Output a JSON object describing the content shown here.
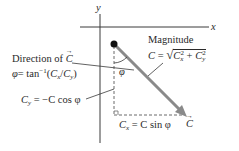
{
  "diagram": {
    "axes": {
      "x_label": "x",
      "y_label": "y"
    },
    "vector": {
      "name": "C",
      "label": "C",
      "color": "#8a8a8a"
    },
    "angle": {
      "symbol": "φ"
    },
    "labels": {
      "direction_title": "Direction of",
      "direction_vector": "C",
      "direction_formula_lhs": "φ",
      "direction_formula_eq": "= tan",
      "direction_formula_exp": "−1",
      "direction_formula_open": "(",
      "direction_formula_c1": "C",
      "direction_formula_c1_sub": "x",
      "direction_formula_slash": "/",
      "direction_formula_c2": "C",
      "direction_formula_c2_sub": "y",
      "direction_formula_close": ")",
      "magnitude_title": "Magnitude",
      "magnitude_lhs": "C",
      "magnitude_eq": "=",
      "magnitude_c1": "C",
      "magnitude_c1_sub": "x",
      "magnitude_c1_sup": "2",
      "magnitude_plus": "+",
      "magnitude_c2": "C",
      "magnitude_c2_sub": "y",
      "magnitude_c2_sup": "2",
      "cy_lhs": "C",
      "cy_sub": "y",
      "cy_rhs": "= −C cos φ",
      "cx_lhs": "C",
      "cx_sub": "x",
      "cx_rhs": "= C sin φ"
    },
    "colors": {
      "axis": "#3a3a3a",
      "vector": "#8a8a8a",
      "dashed": "#6a6a6a",
      "text": "#2a2a2a",
      "dot": "#111111"
    }
  }
}
